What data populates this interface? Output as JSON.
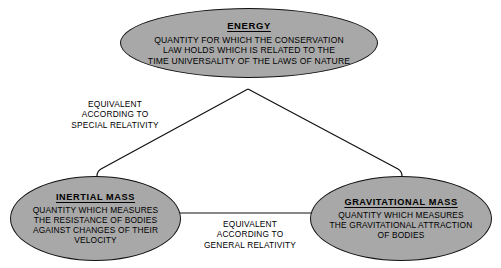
{
  "diagram": {
    "type": "concept-map",
    "background_color": "#ffffff",
    "node_fill_color": "#a8a8a8",
    "node_stroke_color": "#111111",
    "text_color": "#000000",
    "nodes": [
      {
        "id": "energy",
        "title": "ENERGY",
        "body": "QUANTITY FOR WHICH THE CONSERVATION\nLAW HOLDS WHICH IS RELATED TO THE\nTIME UNIVERSALITY OF THE LAWS OF NATURE"
      },
      {
        "id": "inertial-mass",
        "title": "INERTIAL MASS",
        "body": "QUANTITY WHICH MEASURES\nTHE RESISTANCE OF BODIES\nAGAINST CHANGES OF THEIR\nVELOCITY"
      },
      {
        "id": "gravitational-mass",
        "title": "GRAVITATIONAL MASS",
        "body": "QUANTITY WHICH MEASURES\nTHE GRAVITATIONAL ATTRACTION\nOF BODIES"
      }
    ],
    "edges": [
      {
        "id": "energy-to-masses",
        "from": "energy",
        "to": "inertial-mass",
        "label": "EQUIVALENT\nACCORDING TO\nSPECIAL RELATIVITY"
      },
      {
        "id": "inertial-to-gravitational",
        "from": "inertial-mass",
        "to": "gravitational-mass",
        "label": "EQUIVALENT\nACCORDING TO\nGENERAL RELATIVITY"
      }
    ]
  }
}
